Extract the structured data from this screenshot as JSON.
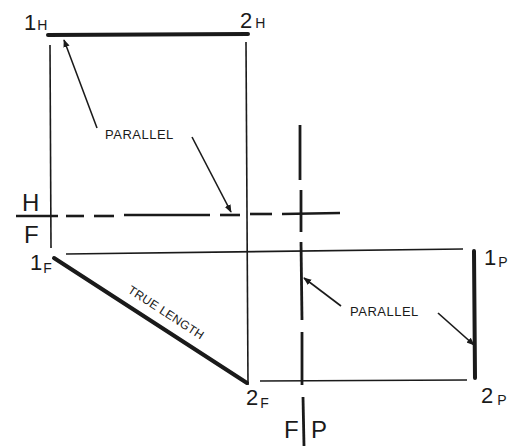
{
  "diagram": {
    "title": "",
    "points": {
      "p1_horizontal": {
        "main": "1",
        "sub": "H"
      },
      "p2_horizontal": {
        "main": "2",
        "sub": "H"
      },
      "p1_front": {
        "main": "1",
        "sub": "F"
      },
      "p2_front": {
        "main": "2",
        "sub": "F"
      },
      "p1_profile": {
        "main": "1",
        "sub": "P"
      },
      "p2_profile": {
        "main": "2",
        "sub": "P"
      }
    },
    "fold_lines": {
      "hf_top": "H",
      "hf_bottom": "F",
      "fp_left": "F",
      "fp_right": "P"
    },
    "annotations": {
      "parallel_top": "PARALLEL",
      "parallel_right": "PARALLEL",
      "true_length": "TRUE LENGTH"
    },
    "colors": {
      "ink": "#1a1a1a",
      "background": "#ffffff"
    }
  }
}
